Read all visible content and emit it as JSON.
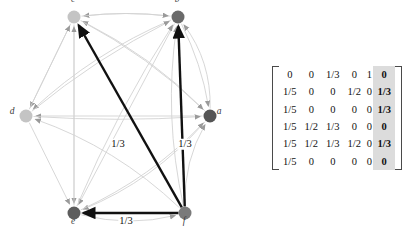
{
  "graph": {
    "nodes": [
      {
        "id": "a",
        "label": "a",
        "x": 210,
        "y": 116,
        "r": 6.5,
        "color": "#555555",
        "label_dx": 9,
        "label_dy": -4
      },
      {
        "id": "b",
        "label": "b",
        "x": 178,
        "y": 17,
        "r": 6.5,
        "color": "#6a6a6a",
        "label_dx": -1,
        "label_dy": -17
      },
      {
        "id": "c",
        "label": "c",
        "x": 74,
        "y": 17,
        "r": 6.5,
        "color": "#c4c4c4",
        "label_dx": -1,
        "label_dy": -17
      },
      {
        "id": "d",
        "label": "d",
        "x": 26,
        "y": 116,
        "r": 6.5,
        "color": "#c4c4c4",
        "label_dx": -14,
        "label_dy": -4
      },
      {
        "id": "e",
        "label": "e",
        "x": 74,
        "y": 213,
        "r": 6.5,
        "color": "#5d5d5d",
        "label_dx": -1,
        "label_dy": 9
      },
      {
        "id": "f",
        "label": "f",
        "x": 185,
        "y": 213,
        "r": 6.5,
        "color": "#7a7a7a",
        "label_dx": -1,
        "label_dy": 9
      }
    ],
    "faint_edges": [
      {
        "from": "a",
        "to": "b",
        "curve": 18
      },
      {
        "from": "a",
        "to": "c",
        "curve": 14
      },
      {
        "from": "a",
        "to": "d",
        "curve": 0
      },
      {
        "from": "a",
        "to": "e",
        "curve": -20
      },
      {
        "from": "b",
        "to": "a",
        "curve": -8
      },
      {
        "from": "b",
        "to": "c",
        "curve": 6
      },
      {
        "from": "b",
        "to": "d",
        "curve": 16
      },
      {
        "from": "b",
        "to": "e",
        "curve": 0
      },
      {
        "from": "c",
        "to": "a",
        "curve": -12
      },
      {
        "from": "c",
        "to": "b",
        "curve": -6
      },
      {
        "from": "c",
        "to": "d",
        "curve": 0
      },
      {
        "from": "c",
        "to": "e",
        "curve": 0
      },
      {
        "from": "d",
        "to": "a",
        "curve": 6
      },
      {
        "from": "d",
        "to": "b",
        "curve": -10
      },
      {
        "from": "d",
        "to": "c",
        "curve": 0
      },
      {
        "from": "d",
        "to": "e",
        "curve": 0
      },
      {
        "from": "e",
        "to": "a",
        "curve": 16
      },
      {
        "from": "e",
        "to": "b",
        "curve": -10
      },
      {
        "from": "e",
        "to": "c",
        "curve": 0
      },
      {
        "from": "e",
        "to": "f",
        "curve": 14
      },
      {
        "from": "f",
        "to": "a",
        "curve": -14
      },
      {
        "from": "f",
        "to": "b",
        "curve": -18
      },
      {
        "from": "f",
        "to": "d",
        "curve": 20
      }
    ],
    "bold_edges": [
      {
        "from": "f",
        "to": "c",
        "label": "1/3",
        "label_x": 118,
        "label_y": 144
      },
      {
        "from": "f",
        "to": "b",
        "label": "1/3",
        "label_x": 185,
        "label_y": 144
      },
      {
        "from": "f",
        "to": "e",
        "label": "1/3",
        "label_x": 126,
        "label_y": 221
      }
    ],
    "colors": {
      "faint_edge": "#d2d2d2",
      "bold_edge": "#111111",
      "node_label": "#3a3a3a"
    }
  },
  "matrix": {
    "rows": [
      [
        "0",
        "0",
        "1/3",
        "0",
        "1",
        "0"
      ],
      [
        "1/5",
        "0",
        "0",
        "1/2",
        "0",
        "1/3"
      ],
      [
        "1/5",
        "0",
        "0",
        "0",
        "0",
        "1/3"
      ],
      [
        "1/5",
        "1/2",
        "1/3",
        "0",
        "0",
        "0"
      ],
      [
        "1/5",
        "1/2",
        "1/3",
        "1/2",
        "0",
        "1/3"
      ],
      [
        "1/5",
        "0",
        "0",
        "0",
        "0",
        "0"
      ]
    ],
    "highlight_column": 5,
    "highlight_color": "#dcdcdc"
  }
}
